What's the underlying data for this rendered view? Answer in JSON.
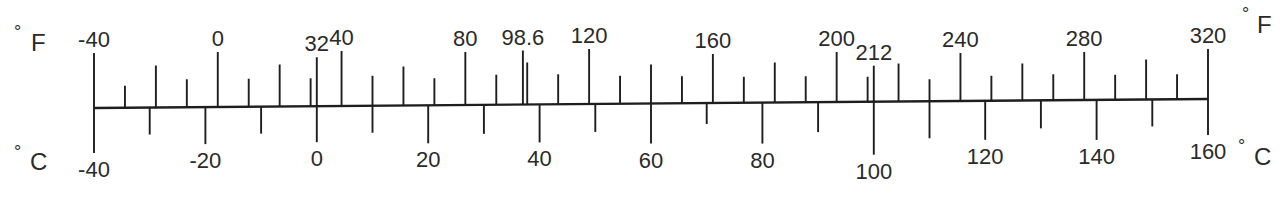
{
  "diagram": {
    "axis": {
      "x_start": 94,
      "y_start": 108,
      "x_end": 1208,
      "y_end": 99,
      "color": "#1e1e1e"
    },
    "fahrenheit": {
      "unit_label": "°F",
      "degree_symbol": "°",
      "letter": "F",
      "min": -40,
      "max": 320,
      "labels": [
        "-40",
        "0",
        "32",
        "40",
        "80",
        "98.6",
        "120",
        "160",
        "200",
        "212",
        "240",
        "280",
        "320"
      ],
      "label_values": [
        -40,
        0,
        32,
        40,
        80,
        98.6,
        120,
        160,
        200,
        212,
        240,
        280,
        320
      ],
      "ticks": [
        {
          "v": -40,
          "len": 55
        },
        {
          "v": -30,
          "len": 22
        },
        {
          "v": -20,
          "len": 42
        },
        {
          "v": -10,
          "len": 28
        },
        {
          "v": 0,
          "len": 55
        },
        {
          "v": 10,
          "len": 28
        },
        {
          "v": 20,
          "len": 42
        },
        {
          "v": 30,
          "len": 28
        },
        {
          "v": 32,
          "len": 49
        },
        {
          "v": 40,
          "len": 55
        },
        {
          "v": 50,
          "len": 30
        },
        {
          "v": 60,
          "len": 39
        },
        {
          "v": 70,
          "len": 27
        },
        {
          "v": 80,
          "len": 53
        },
        {
          "v": 90,
          "len": 30
        },
        {
          "v": 98.6,
          "len": 54
        },
        {
          "v": 100,
          "len": 42
        },
        {
          "v": 110,
          "len": 30
        },
        {
          "v": 120,
          "len": 55
        },
        {
          "v": 130,
          "len": 28
        },
        {
          "v": 140,
          "len": 39
        },
        {
          "v": 150,
          "len": 27
        },
        {
          "v": 160,
          "len": 49
        },
        {
          "v": 170,
          "len": 26
        },
        {
          "v": 180,
          "len": 40
        },
        {
          "v": 190,
          "len": 26
        },
        {
          "v": 200,
          "len": 50
        },
        {
          "v": 210,
          "len": 25
        },
        {
          "v": 212,
          "len": 36
        },
        {
          "v": 220,
          "len": 38
        },
        {
          "v": 230,
          "len": 22
        },
        {
          "v": 240,
          "len": 48
        },
        {
          "v": 250,
          "len": 25
        },
        {
          "v": 260,
          "len": 37
        },
        {
          "v": 270,
          "len": 26
        },
        {
          "v": 280,
          "len": 48
        },
        {
          "v": 290,
          "len": 25
        },
        {
          "v": 300,
          "len": 40
        },
        {
          "v": 310,
          "len": 25
        },
        {
          "v": 320,
          "len": 50
        }
      ]
    },
    "celsius": {
      "unit_label": "°C",
      "degree_symbol": "°",
      "letter": "C",
      "min": -40,
      "max": 160,
      "labels": [
        "-40",
        "-20",
        "0",
        "20",
        "40",
        "60",
        "80",
        "100",
        "120",
        "140",
        "160"
      ],
      "label_values": [
        -40,
        -20,
        0,
        20,
        40,
        60,
        80,
        100,
        120,
        140,
        160
      ],
      "ticks": [
        {
          "v": -40,
          "len": 45
        },
        {
          "v": -30,
          "len": 27
        },
        {
          "v": -20,
          "len": 37
        },
        {
          "v": -10,
          "len": 27
        },
        {
          "v": 0,
          "len": 36
        },
        {
          "v": 10,
          "len": 27
        },
        {
          "v": 20,
          "len": 38
        },
        {
          "v": 30,
          "len": 29
        },
        {
          "v": 40,
          "len": 38
        },
        {
          "v": 50,
          "len": 28
        },
        {
          "v": 60,
          "len": 40
        },
        {
          "v": 70,
          "len": 21
        },
        {
          "v": 80,
          "len": 41
        },
        {
          "v": 90,
          "len": 30
        },
        {
          "v": 100,
          "len": 53
        },
        {
          "v": 110,
          "len": 37
        },
        {
          "v": 120,
          "len": 39
        },
        {
          "v": 130,
          "len": 28
        },
        {
          "v": 140,
          "len": 40
        },
        {
          "v": 150,
          "len": 27
        },
        {
          "v": 160,
          "len": 36
        }
      ]
    }
  }
}
